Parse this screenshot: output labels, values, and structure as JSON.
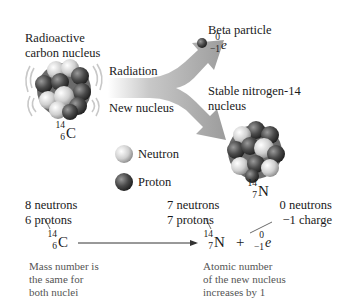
{
  "diagram": {
    "title_left": [
      "Radioactive",
      "carbon nucleus"
    ],
    "arrow_labels": {
      "radiation": "Radiation",
      "new_nucleus": "New nucleus"
    },
    "beta": {
      "label": "Beta particle",
      "symbol": {
        "mass": "0",
        "charge": "−1",
        "sym": "e"
      }
    },
    "nitrogen": {
      "label": [
        "Stable nitrogen-14",
        "nucleus"
      ],
      "symbol": {
        "mass": "14",
        "atomic": "7",
        "sym": "N"
      }
    },
    "carbon": {
      "symbol": {
        "mass": "14",
        "atomic": "6",
        "sym": "C"
      }
    },
    "legend": {
      "neutron": "Neutron",
      "proton": "Proton"
    },
    "equation": {
      "carbon_counts": [
        "8 neutrons",
        "6 protons"
      ],
      "nitrogen_counts": [
        "7 neutrons",
        "7 protons"
      ],
      "electron_counts": [
        "0 neutrons",
        "−1 charge"
      ],
      "reactant": {
        "mass": "14",
        "atomic": "6",
        "sym": "C"
      },
      "product1": {
        "mass": "14",
        "atomic": "7",
        "sym": "N"
      },
      "plus": "+",
      "product2": {
        "mass": "0",
        "atomic": "−1",
        "sym": "e"
      }
    },
    "notes": {
      "mass": [
        "Mass number is",
        "the same for",
        "both nuclei"
      ],
      "atomic": [
        "Atomic number",
        "of the new nucleus",
        "increases by 1"
      ]
    },
    "colors": {
      "arrow_gray": "#9a9a9a",
      "proton": "#4a4a4a",
      "neutron": "#e0e0e0"
    }
  }
}
